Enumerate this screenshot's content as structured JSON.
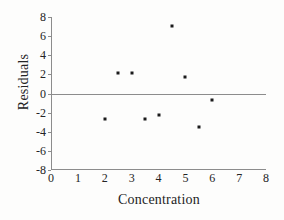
{
  "chart_data": {
    "type": "scatter",
    "title": "",
    "xlabel": "Concentration",
    "ylabel": "Residuals",
    "xlim": [
      0,
      8
    ],
    "ylim": [
      -8,
      8
    ],
    "xticks": [
      0,
      1,
      2,
      3,
      4,
      5,
      6,
      7,
      8
    ],
    "yticks": [
      8,
      6,
      4,
      2,
      0,
      -2,
      -4,
      -6,
      -8
    ],
    "xtick_labels": [
      "0",
      "1",
      "2",
      "3",
      "4",
      "5",
      "6",
      "7",
      "8"
    ],
    "ytick_labels": [
      "8",
      "6",
      "4",
      "2",
      "0",
      "-2",
      "-4",
      "-6",
      "-8"
    ],
    "grid": false,
    "legend": null,
    "reference_line": {
      "name": "zero-residual-line",
      "y": 0
    },
    "marker": {
      "shape": "square",
      "color": "#1b1b1b",
      "size": 3
    },
    "points": [
      {
        "x": 2.0,
        "y": -2.7
      },
      {
        "x": 2.5,
        "y": 2.1
      },
      {
        "x": 3.0,
        "y": 2.1
      },
      {
        "x": 3.5,
        "y": -2.7
      },
      {
        "x": 4.0,
        "y": -2.3
      },
      {
        "x": 4.5,
        "y": 7.1
      },
      {
        "x": 5.0,
        "y": 1.7
      },
      {
        "x": 5.5,
        "y": -3.5
      },
      {
        "x": 6.0,
        "y": -0.7
      }
    ],
    "x": [
      2.0,
      2.5,
      3.0,
      3.5,
      4.0,
      4.5,
      5.0,
      5.5,
      6.0
    ],
    "values": [
      -2.7,
      2.1,
      2.1,
      -2.7,
      -2.3,
      7.1,
      1.7,
      -3.5,
      -0.7
    ],
    "axis_color": "#8c8c8c",
    "background_color": "#fdfdfc"
  }
}
